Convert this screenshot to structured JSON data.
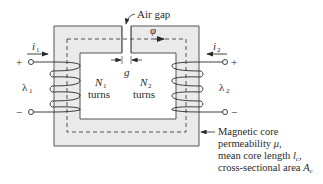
{
  "figure": {
    "type": "magnetic-circuit-diagram",
    "core": {
      "fill_color": "#eaeaea",
      "edge_color": "#555555"
    },
    "labels": {
      "air_gap": "Air gap",
      "flux": "φ",
      "gap_length": "g",
      "current_1": "i",
      "current_1_sub": "1",
      "current_2": "i",
      "current_2_sub": "2",
      "flux_linkage_1": "λ",
      "flux_linkage_1_sub": "1",
      "flux_linkage_2": "λ",
      "flux_linkage_2_sub": "2",
      "turns_1_symbol": "N",
      "turns_1_sub": "1",
      "turns_1_word": "turns",
      "turns_2_symbol": "N",
      "turns_2_sub": "2",
      "turns_2_word": "turns",
      "plus_1": "+",
      "minus_1": "−",
      "plus_2": "+",
      "minus_2": "−"
    },
    "core_description": {
      "line1": "Magnetic core",
      "line2_text": "permeability ",
      "line2_symbol": "μ",
      "line2_end": ",",
      "line3_text": "mean core length ",
      "line3_symbol": "l",
      "line3_sub": "c",
      "line3_end": ",",
      "line4_text": "cross-sectional area ",
      "line4_symbol": "A",
      "line4_sub": "c"
    }
  }
}
